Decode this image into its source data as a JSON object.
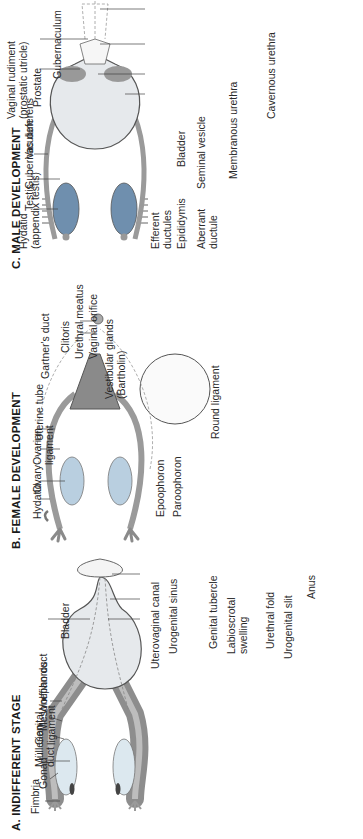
{
  "figure": {
    "orientation": "rotated 90 degrees counterclockwise",
    "panels": [
      {
        "id": "A",
        "title": "A.  INDIFFERENT STAGE",
        "labels": {
          "fimbria": "Fimbria",
          "gonad": "Gonad",
          "mullerian_duct_1": "Müllerian",
          "mullerian_duct_2": "duct",
          "genital_ligament_1": "Genital",
          "genital_ligament_2": "ligament",
          "mesonephoros": "Mesonephoros",
          "wolffian_duct": "Wolffian duct",
          "bladder": "Bladder",
          "uterovaginal_canal": "Uterovaginal canal",
          "urogenital_sinus": "Urogenital sinus",
          "genital_tubercle": "Genital tubercle",
          "labioscrotal_swelling_1": "Labioscrotal",
          "labioscrotal_swelling_2": "swelling",
          "urethral_fold": "Urethral fold",
          "urogenital_slit": "Urogenital slit",
          "anus": "Anus"
        }
      },
      {
        "id": "B",
        "title": "B.  FEMALE DEVELOPMENT",
        "labels": {
          "hydatid": "Hydatid",
          "ovary": "Ovary",
          "ovarian_ligament_1": "Ovarian",
          "ovarian_ligament_2": "ligament",
          "uterine_tube": "Uterine tube",
          "epoophoron": "Epoophoron",
          "paroophoron": "Paroophoron",
          "round_ligament": "Round ligament",
          "gartners_duct": "Gartner's duct",
          "clitoris": "Clitoris",
          "urethral_meatus": "Urethral meatus",
          "vaginal_orifice": "Vaginal orifice",
          "vestibular_glands_1": "Vestibular glands",
          "vestibular_glands_2": "(Bartholin)"
        }
      },
      {
        "id": "C",
        "title": "C.  MALE DEVELOPMENT",
        "labels": {
          "hydatid_1": "Hydatid",
          "hydatid_2": "(appendix testis)",
          "testis": "Testis",
          "gubernaculum_upper": "Gubernaculum",
          "vas_deferens": "Vas deferens",
          "efferent_ductules_1": "Efferent",
          "efferent_ductules_2": "ductules",
          "epididymis": "Epididymis",
          "aberrant_ductule_1": "Aberrant",
          "aberrant_ductule_2": "ductule",
          "bladder": "Bladder",
          "seminal_vesicle": "Seminal vesicle",
          "membranous_urethra": "Membranous urethra",
          "cavernous_urethra": "Cavernous urethra",
          "vaginal_rudiment_1": "Vaginal rudiment",
          "vaginal_rudiment_2": "(prostatic utricle)",
          "prostate": "Prostate",
          "gubernaculum_lower": "Gubernaculum"
        }
      }
    ],
    "colors": {
      "gonad_fill": "#dce8ef",
      "ovary_fill": "#b9cfe0",
      "testis_fill": "#6f8fae",
      "duct_gray": "#9a9a9a",
      "dark_gray": "#7d7d7d",
      "bladder_fill": "#e6e9ec",
      "line": "#555555"
    }
  }
}
